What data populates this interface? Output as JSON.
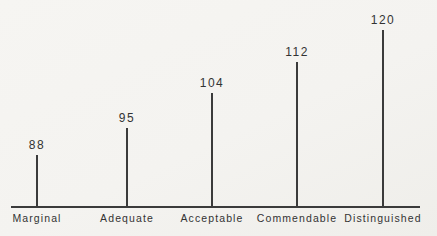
{
  "figure": {
    "background": "#f4f3f0",
    "ink_color": "#3b3b3b"
  },
  "chart_data": {
    "type": "stem",
    "categories": [
      "Marginal",
      "Adequate",
      "Acceptable",
      "Commendable",
      "Distinguished"
    ],
    "values": [
      88,
      95,
      104,
      112,
      120
    ],
    "value_labels": [
      "88",
      "95",
      "104",
      "112",
      "120"
    ],
    "title": "",
    "xlabel": "",
    "ylabel": "",
    "ylim": [
      75,
      125
    ],
    "layout": {
      "grid": false,
      "legend": "none",
      "y_axis_shown": false,
      "x_axis_baseline_only": true,
      "value_labels_position": "above-stem"
    }
  }
}
